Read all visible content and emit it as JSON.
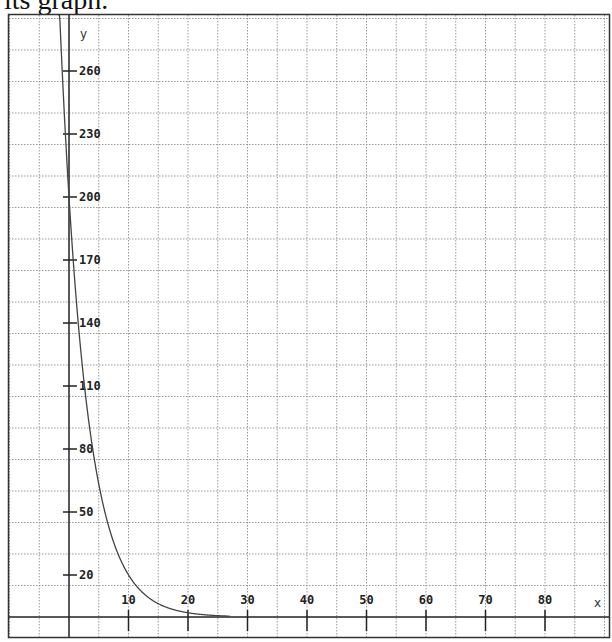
{
  "caption": "its graph.",
  "chart_data": {
    "type": "line",
    "title": "",
    "xlabel": "x",
    "ylabel": "y",
    "x_ticks": [
      10,
      20,
      30,
      40,
      50,
      60,
      70,
      80
    ],
    "y_ticks": [
      20,
      50,
      80,
      110,
      140,
      170,
      200,
      230,
      260
    ],
    "xlim": [
      -10,
      90
    ],
    "ylim": [
      -10,
      288
    ],
    "grid": true,
    "grid_x_step": 5,
    "grid_y_step": 15,
    "series": [
      {
        "name": "y = 200·e^(-0.23x)",
        "x": [
          -1.8,
          0,
          2,
          4,
          6,
          8,
          10,
          12,
          14,
          16,
          18,
          20,
          22,
          24,
          26,
          27
        ],
        "values": [
          302,
          200,
          126,
          80,
          50,
          32,
          20,
          13,
          8,
          5,
          3,
          2,
          1.3,
          0.8,
          0.5,
          0.4
        ]
      }
    ],
    "legend": null
  }
}
